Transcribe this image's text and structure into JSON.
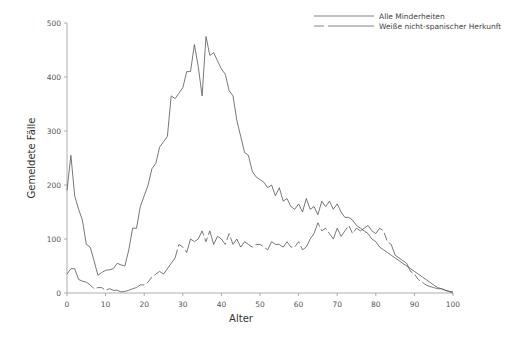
{
  "chart_data": {
    "type": "line",
    "title": "",
    "xlabel": "Alter",
    "ylabel": "Gemeldete Fälle",
    "xlim": [
      0,
      100
    ],
    "ylim": [
      0,
      500
    ],
    "xticks": [
      0,
      10,
      20,
      30,
      40,
      50,
      60,
      70,
      80,
      90,
      100
    ],
    "yticks": [
      0,
      100,
      200,
      300,
      400,
      500
    ],
    "grid": false,
    "legend_position": "top-right",
    "x": [
      0,
      1,
      2,
      3,
      4,
      5,
      6,
      7,
      8,
      9,
      10,
      11,
      12,
      13,
      14,
      15,
      16,
      17,
      18,
      19,
      20,
      21,
      22,
      23,
      24,
      25,
      26,
      27,
      28,
      29,
      30,
      31,
      32,
      33,
      34,
      35,
      36,
      37,
      38,
      39,
      40,
      41,
      42,
      43,
      44,
      45,
      46,
      47,
      48,
      49,
      50,
      51,
      52,
      53,
      54,
      55,
      56,
      57,
      58,
      59,
      60,
      61,
      62,
      63,
      64,
      65,
      66,
      67,
      68,
      69,
      70,
      71,
      72,
      73,
      74,
      75,
      76,
      77,
      78,
      79,
      80,
      81,
      82,
      83,
      84,
      85,
      86,
      87,
      88,
      89,
      90,
      91,
      92,
      93,
      94,
      95,
      96,
      97,
      98,
      99,
      100
    ],
    "series": [
      {
        "name": "Alle Minderheiten",
        "style": "solid",
        "values": [
          190,
          255,
          180,
          155,
          135,
          90,
          85,
          60,
          33,
          38,
          42,
          43,
          45,
          55,
          52,
          50,
          80,
          120,
          120,
          160,
          180,
          200,
          230,
          240,
          270,
          280,
          290,
          365,
          360,
          370,
          380,
          410,
          410,
          460,
          420,
          365,
          475,
          440,
          445,
          430,
          415,
          405,
          375,
          365,
          320,
          290,
          260,
          255,
          225,
          215,
          210,
          205,
          195,
          200,
          180,
          195,
          170,
          175,
          160,
          155,
          165,
          150,
          175,
          155,
          160,
          145,
          170,
          160,
          170,
          155,
          165,
          150,
          140,
          140,
          135,
          125,
          120,
          115,
          110,
          100,
          95,
          85,
          80,
          75,
          70,
          65,
          60,
          55,
          50,
          45,
          40,
          35,
          30,
          25,
          20,
          15,
          10,
          8,
          5,
          3,
          2
        ]
      },
      {
        "name": "Weiße nicht-spanischer Herkunft",
        "style": "dashed",
        "values": [
          35,
          45,
          45,
          25,
          22,
          20,
          15,
          8,
          10,
          10,
          5,
          8,
          5,
          5,
          2,
          3,
          5,
          8,
          10,
          15,
          15,
          20,
          30,
          35,
          40,
          35,
          45,
          55,
          65,
          90,
          85,
          75,
          100,
          95,
          100,
          115,
          95,
          115,
          90,
          105,
          100,
          90,
          110,
          90,
          100,
          85,
          95,
          90,
          85,
          90,
          90,
          85,
          80,
          95,
          90,
          90,
          85,
          95,
          85,
          85,
          95,
          80,
          85,
          100,
          110,
          130,
          115,
          120,
          110,
          100,
          120,
          105,
          115,
          125,
          110,
          120,
          115,
          120,
          125,
          115,
          110,
          120,
          115,
          95,
          90,
          70,
          65,
          60,
          55,
          40,
          35,
          25,
          20,
          15,
          12,
          10,
          8,
          8,
          5,
          3,
          0
        ]
      }
    ]
  },
  "legend": {
    "items": [
      {
        "label": "Alle Minderheiten",
        "style": "solid"
      },
      {
        "label": "Weiße nicht-spanischer Herkunft",
        "style": "dashed"
      }
    ]
  },
  "axes": {
    "x_label": "Alter",
    "y_label": "Gemeldete Fälle",
    "x_ticks": [
      "0",
      "10",
      "20",
      "30",
      "40",
      "50",
      "60",
      "70",
      "80",
      "90",
      "100"
    ],
    "y_ticks": [
      "0",
      "100",
      "200",
      "300",
      "400",
      "500"
    ]
  },
  "colors": {
    "line": "#555555",
    "axis": "#888888",
    "text": "#444444"
  }
}
